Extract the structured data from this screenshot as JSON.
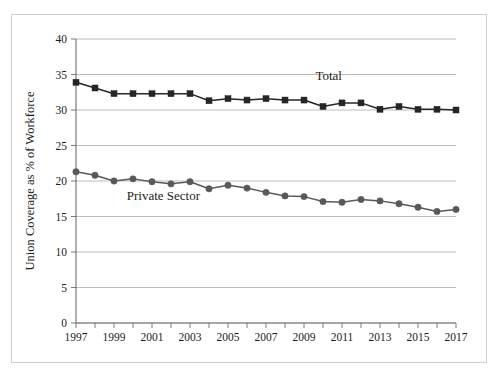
{
  "chart_data": {
    "type": "line",
    "title": "",
    "subtitle": "",
    "xlabel": "",
    "ylabel": "Union Coverage as % of Workforce",
    "xlim": [
      1997,
      2017
    ],
    "ylim": [
      0,
      40
    ],
    "yticks": [
      0,
      5,
      10,
      15,
      20,
      25,
      30,
      35,
      40
    ],
    "ytick_labels": [
      "0",
      "5",
      "10",
      "15",
      "20",
      "25",
      "30",
      "35",
      "40"
    ],
    "xticks": [
      1997,
      1998,
      1999,
      2000,
      2001,
      2002,
      2003,
      2004,
      2005,
      2006,
      2007,
      2008,
      2009,
      2010,
      2011,
      2012,
      2013,
      2014,
      2015,
      2016,
      2017
    ],
    "xtick_labels_shown": [
      "1997",
      "1999",
      "2001",
      "2003",
      "2005",
      "2007",
      "2009",
      "2011",
      "2013",
      "2015",
      "2017"
    ],
    "x": [
      1997,
      1998,
      1999,
      2000,
      2001,
      2002,
      2003,
      2004,
      2005,
      2006,
      2007,
      2008,
      2009,
      2010,
      2011,
      2012,
      2013,
      2014,
      2015,
      2016,
      2017
    ],
    "grid": true,
    "grid_axis": "y",
    "legend_position": "inline-annotation",
    "series": [
      {
        "name": "Total",
        "label_text": "Total",
        "color": "#262626",
        "marker": "square",
        "values": [
          33.9,
          33.1,
          32.3,
          32.3,
          32.3,
          32.3,
          32.3,
          31.3,
          31.6,
          31.4,
          31.6,
          31.4,
          31.4,
          30.5,
          31.0,
          31.0,
          30.1,
          30.5,
          30.1,
          30.1,
          30.0
        ]
      },
      {
        "name": "Private Sector",
        "label_text": "Private Sector",
        "color": "#595959",
        "marker": "circle",
        "values": [
          21.3,
          20.8,
          20.0,
          20.3,
          19.9,
          19.6,
          19.9,
          18.9,
          19.4,
          19.0,
          18.4,
          17.9,
          17.8,
          17.1,
          17.0,
          17.4,
          17.2,
          16.8,
          16.3,
          15.7,
          16.0
        ]
      }
    ],
    "annotations": [
      {
        "text": "Total",
        "x": 2010.3,
        "y": 34.2
      },
      {
        "text": "Private Sector",
        "x": 2001.6,
        "y": 17.3
      }
    ]
  },
  "colors": {
    "frame": "#cfcfcf",
    "grid": "#b5b5b5",
    "axis": "#6e6e6e",
    "total": "#262626",
    "private": "#595959",
    "text": "#1c1c1c",
    "background": "#ffffff"
  }
}
